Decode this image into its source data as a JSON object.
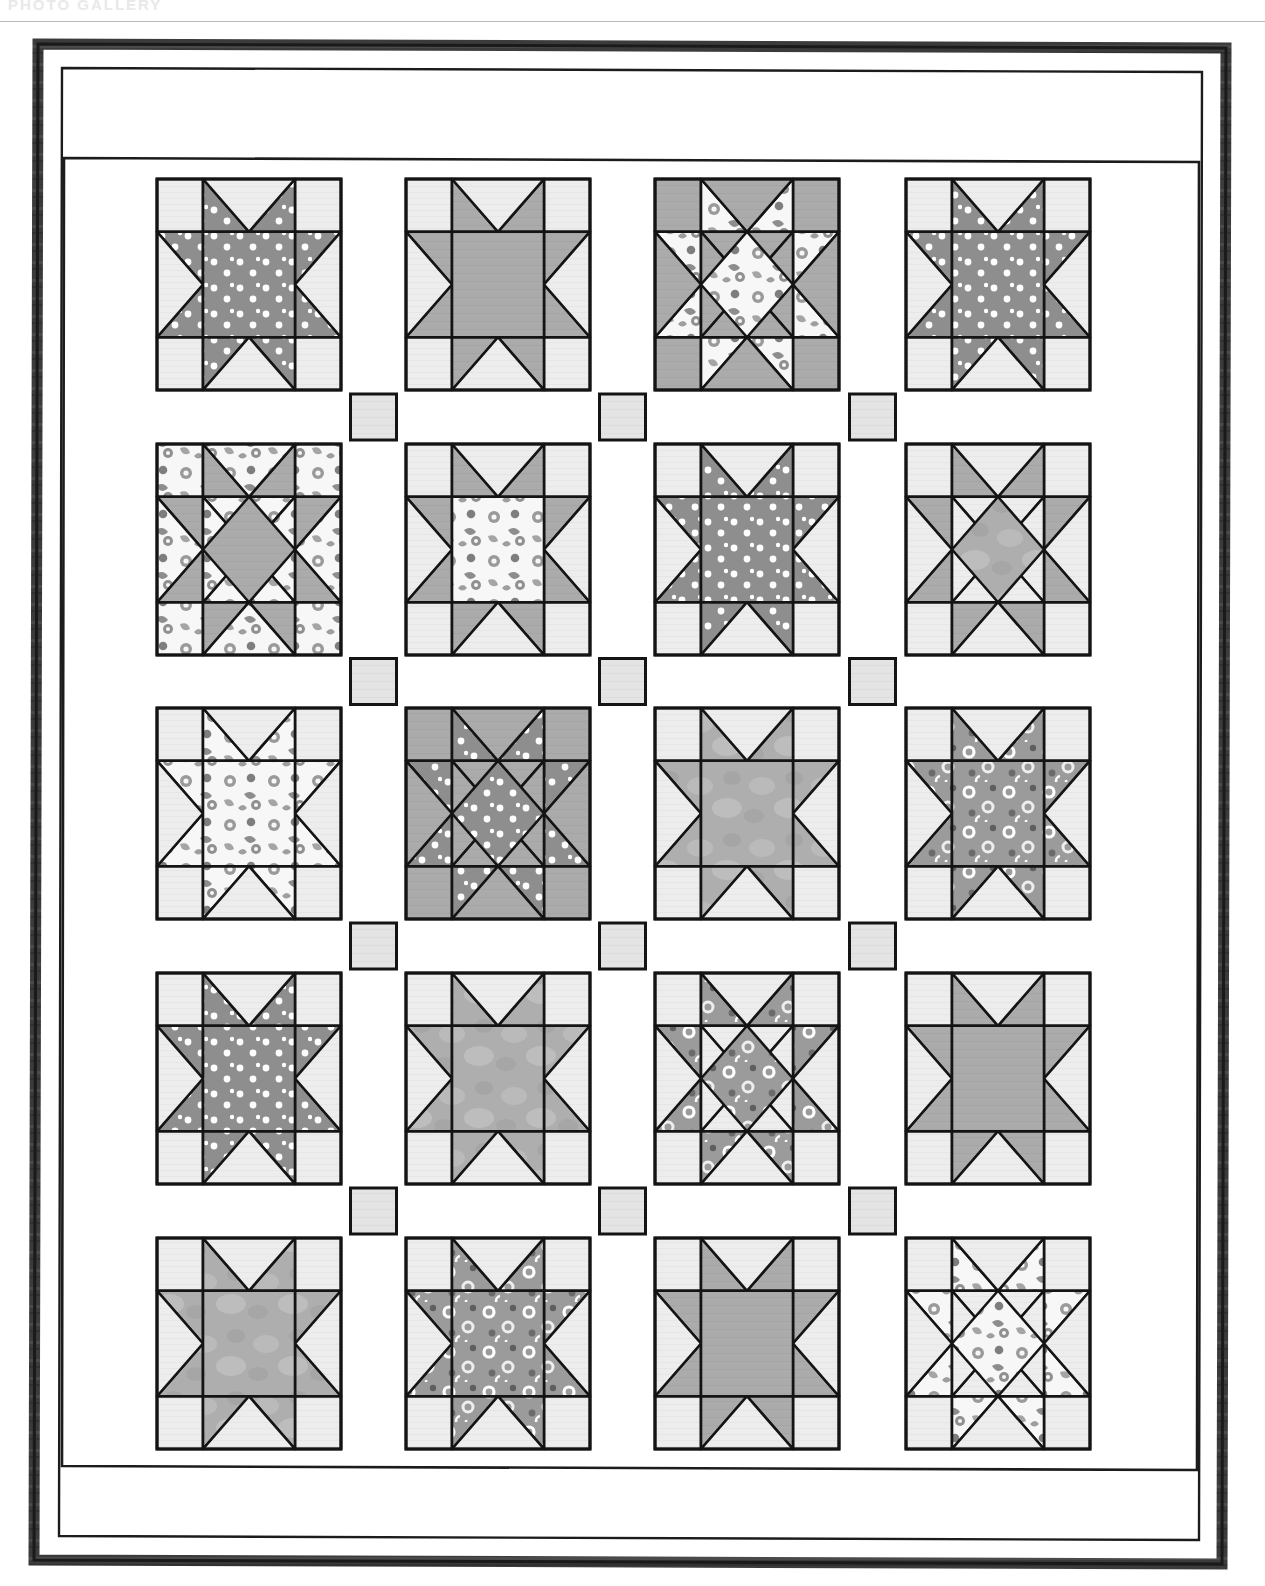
{
  "page": {
    "header_text": "PHOTO GALLERY",
    "background": "#ffffff",
    "rule_color": "#b9b9b9"
  },
  "quilt": {
    "title": "Sawtooth and Ohio Star Sampler Quilt Diagram",
    "grid": {
      "rows": 5,
      "cols": 4
    },
    "geometry": {
      "outer_border_x": 36,
      "outer_border_y": 20,
      "outer_border_w": 1192,
      "outer_border_h": 1524,
      "outer_border_stroke": 9,
      "inner_panel_x": 62,
      "inner_panel_y": 44,
      "inner_panel_w": 1140,
      "inner_panel_h": 1476,
      "block_size": 184,
      "sash_width": 64,
      "block_x": [
        157,
        406,
        655,
        906
      ],
      "block_y": [
        157,
        422,
        686,
        951,
        1216
      ],
      "block_h": 211
    },
    "colors": {
      "ink": "#141414",
      "background_white": "#ffffff",
      "border_fabric": "#3a3a3a",
      "sash_white": "#ffffff",
      "cornerstone": "#e3e3e3",
      "block_bg_light": "#ececec",
      "solid_gray": "#a9a9a9",
      "dark_gray_dot": "#8c8c8c",
      "mottled_gray": "#b0b0b0",
      "floral_light": "#f6f6f6",
      "ring_dark": "#8f8f8f",
      "ring_mid": "#a0a0a0"
    },
    "fabric_legend": [
      {
        "key": "dot",
        "label": "gray polka dot"
      },
      {
        "key": "solid",
        "label": "medium gray solid"
      },
      {
        "key": "floral",
        "label": "light floral print"
      },
      {
        "key": "mottled",
        "label": "mottled gray batik"
      },
      {
        "key": "ring",
        "label": "gray ring print"
      },
      {
        "key": "plain",
        "label": "light background"
      }
    ],
    "blocks": [
      {
        "row": 1,
        "col": 1,
        "style": "sawtooth",
        "center": "dot",
        "points": "dot",
        "bg": "plain",
        "name": "block-r1c1"
      },
      {
        "row": 1,
        "col": 2,
        "style": "sawtooth",
        "center": "solid",
        "points": "solid",
        "bg": "plain",
        "name": "block-r1c2"
      },
      {
        "row": 1,
        "col": 3,
        "style": "ohio",
        "center": "floral",
        "points": "floral",
        "bg": "solid",
        "name": "block-r1c3"
      },
      {
        "row": 1,
        "col": 4,
        "style": "sawtooth",
        "center": "dot",
        "points": "dot",
        "bg": "plain",
        "name": "block-r1c4"
      },
      {
        "row": 2,
        "col": 1,
        "style": "ohio",
        "center": "solid",
        "points": "solid",
        "bg": "floral",
        "name": "block-r2c1"
      },
      {
        "row": 2,
        "col": 2,
        "style": "sawtooth",
        "center": "floral",
        "points": "solid",
        "bg": "plain",
        "name": "block-r2c2"
      },
      {
        "row": 2,
        "col": 3,
        "style": "sawtooth",
        "center": "dot",
        "points": "dot",
        "bg": "plain",
        "name": "block-r2c3"
      },
      {
        "row": 2,
        "col": 4,
        "style": "ohio",
        "center": "mottled",
        "points": "solid",
        "bg": "plain",
        "name": "block-r2c4"
      },
      {
        "row": 3,
        "col": 1,
        "style": "sawtooth",
        "center": "floral",
        "points": "floral",
        "bg": "plain",
        "name": "block-r3c1"
      },
      {
        "row": 3,
        "col": 2,
        "style": "ohio",
        "center": "dot",
        "points": "dot",
        "bg": "solid",
        "name": "block-r3c2"
      },
      {
        "row": 3,
        "col": 3,
        "style": "sawtooth",
        "center": "mottled",
        "points": "mottled",
        "bg": "plain",
        "name": "block-r3c3"
      },
      {
        "row": 3,
        "col": 4,
        "style": "sawtooth",
        "center": "ring",
        "points": "ring",
        "bg": "plain",
        "name": "block-r3c4"
      },
      {
        "row": 4,
        "col": 1,
        "style": "sawtooth",
        "center": "dot",
        "points": "dot",
        "bg": "plain",
        "name": "block-r4c1"
      },
      {
        "row": 4,
        "col": 2,
        "style": "sawtooth",
        "center": "mottled",
        "points": "mottled",
        "bg": "plain",
        "name": "block-r4c2"
      },
      {
        "row": 4,
        "col": 3,
        "style": "ohio",
        "center": "ring",
        "points": "ring",
        "bg": "plain",
        "name": "block-r4c3"
      },
      {
        "row": 4,
        "col": 4,
        "style": "sawtooth",
        "center": "solid",
        "points": "solid",
        "bg": "plain",
        "name": "block-r4c4"
      },
      {
        "row": 5,
        "col": 1,
        "style": "sawtooth",
        "center": "mottled",
        "points": "mottled",
        "bg": "plain",
        "name": "block-r5c1"
      },
      {
        "row": 5,
        "col": 2,
        "style": "sawtooth",
        "center": "ring",
        "points": "ring",
        "bg": "plain",
        "name": "block-r5c2"
      },
      {
        "row": 5,
        "col": 3,
        "style": "sawtooth",
        "center": "solid",
        "points": "solid",
        "bg": "plain",
        "name": "block-r5c3"
      },
      {
        "row": 5,
        "col": 4,
        "style": "ohio",
        "center": "floral",
        "points": "floral",
        "bg": "plain",
        "name": "block-r5c4"
      }
    ]
  }
}
